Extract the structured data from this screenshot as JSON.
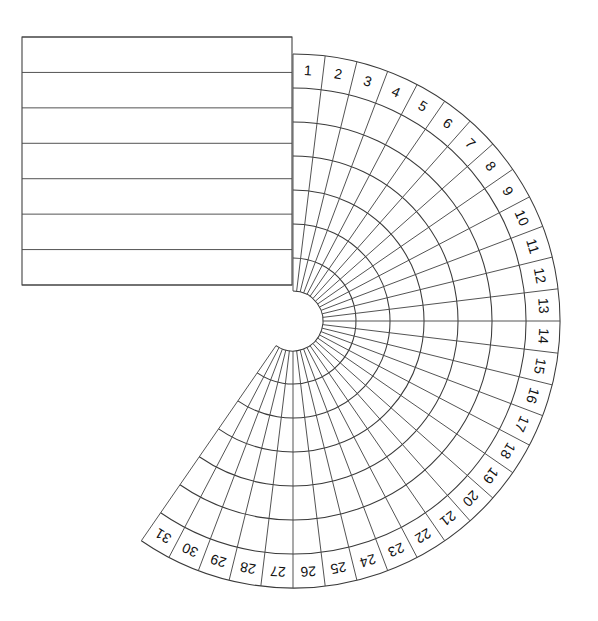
{
  "figure": {
    "background_color": "#ffffff",
    "line_color": "#3a3a3a",
    "label_color": "#111111"
  },
  "geometry": {
    "center_x": 293,
    "center_y": 321,
    "inner_radius": 30,
    "outer_radius": 267,
    "ring_count": 7,
    "ring_radii": [
      30,
      63,
      97,
      131,
      165,
      199,
      233,
      267
    ],
    "sector_count": 31,
    "sector_start_angle_deg": -90,
    "sector_sweep_deg": 6.923,
    "total_sweep_deg": 214.6
  },
  "rectangle": {
    "left": 22,
    "top": 37,
    "right": 292,
    "bottom": 285,
    "row_count": 7,
    "row_line_y": [
      37,
      72.43,
      107.86,
      143.29,
      178.71,
      214.14,
      249.57,
      285
    ],
    "rows": [
      "",
      "",
      "",
      "",
      "",
      "",
      ""
    ]
  },
  "chart_data": {
    "type": "table",
    "title": "",
    "xlabel": "",
    "ylabel": "",
    "sector_labels": [
      "1",
      "2",
      "3",
      "4",
      "5",
      "6",
      "7",
      "8",
      "9",
      "10",
      "11",
      "12",
      "13",
      "14",
      "15",
      "16",
      "17",
      "18",
      "19",
      "20",
      "21",
      "22",
      "23",
      "24",
      "25",
      "26",
      "27",
      "28",
      "29",
      "30",
      "31"
    ],
    "ring_labels": [
      "",
      "",
      "",
      "",
      "",
      "",
      ""
    ],
    "values": [],
    "grid": true,
    "legend": "none"
  }
}
